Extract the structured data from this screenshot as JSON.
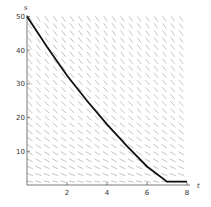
{
  "chart_data": {
    "type": "line",
    "title": "",
    "xlabel": "t",
    "ylabel": "s",
    "xlim": [
      0,
      8
    ],
    "ylim": [
      0,
      50
    ],
    "x_ticks": [
      "2",
      "4",
      "6",
      "8"
    ],
    "y_ticks": [
      "10",
      "20",
      "30",
      "40",
      "50"
    ],
    "grid": false,
    "legend": null,
    "background": "slope field (direction field segments)",
    "series": [
      {
        "name": "solution curve",
        "x": [
          0,
          1,
          2,
          3,
          4,
          5,
          6,
          7,
          8
        ],
        "values": [
          50,
          41,
          32.5,
          25,
          18,
          11.5,
          5.5,
          1,
          1
        ]
      }
    ]
  }
}
